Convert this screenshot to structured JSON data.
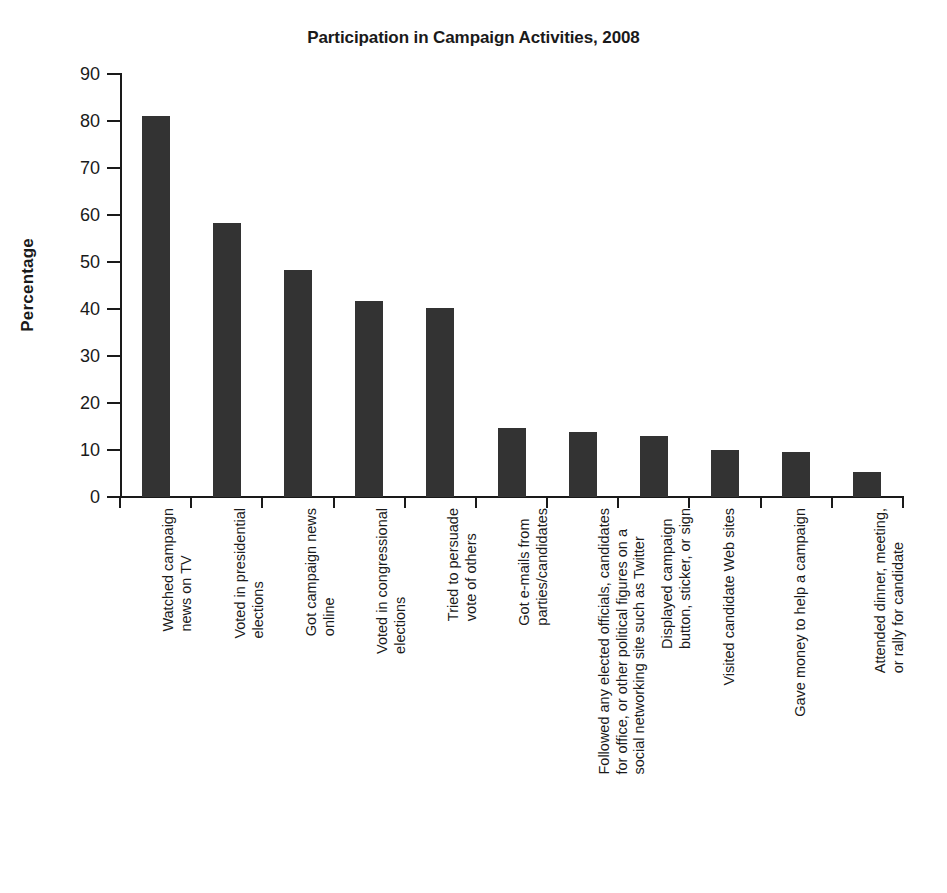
{
  "chart_data": {
    "type": "bar",
    "title": "Participation in Campaign Activities, 2008",
    "xlabel": "",
    "ylabel": "Percentage",
    "ylim": [
      0,
      90
    ],
    "yticks": [
      0,
      10,
      20,
      30,
      40,
      50,
      60,
      70,
      80,
      90
    ],
    "ytick_labels": [
      "0",
      "10",
      "20",
      "30",
      "40",
      "50",
      "60",
      "70",
      "80",
      "90"
    ],
    "grid": false,
    "legend": "none",
    "bar_color": "#333333",
    "axis_color": "#1a1a1a",
    "background": "#ffffff",
    "categories": [
      "Watched campaign\nnews on TV",
      "Voted in presidential\nelections",
      "Got campaign news\nonline",
      "Voted in congressional\nelections",
      "Tried to persuade\nvote of others",
      "Got e-mails from\nparties/candidates",
      "Followed any elected officials, candidates\nfor office, or other political figures on a\nsocial networking site such as Twitter",
      "Displayed campaign\nbutton, sticker, or sign",
      "Visited candidate Web sites",
      "Gave money to help a campaign",
      "Attended dinner, meeting,\nor rally for candidate"
    ],
    "values": [
      81.0,
      58.2,
      48.4,
      41.8,
      40.2,
      14.7,
      13.8,
      12.9,
      10.0,
      9.5,
      5.4
    ]
  }
}
